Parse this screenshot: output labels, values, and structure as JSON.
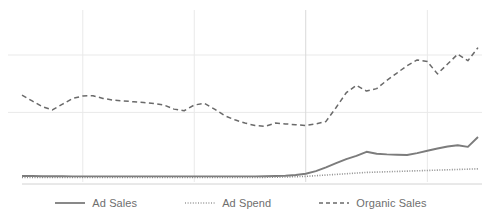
{
  "chart_data": {
    "type": "line",
    "title": "",
    "subtitle": "",
    "xlabel": "",
    "ylabel": "",
    "grid": true,
    "legend_position": "bottom",
    "xlim": [
      0,
      45
    ],
    "ylim": [
      0,
      100
    ],
    "xticks": [],
    "yticks": [],
    "gridlines": {
      "horizontal_y_values": [
        40,
        75
      ],
      "vertical_x_values": [
        6,
        17,
        28,
        40
      ]
    },
    "x": [
      0,
      1,
      2,
      3,
      4,
      5,
      6,
      7,
      8,
      9,
      10,
      11,
      12,
      13,
      14,
      15,
      16,
      17,
      18,
      19,
      20,
      21,
      22,
      23,
      24,
      25,
      26,
      27,
      28,
      29,
      30,
      31,
      32,
      33,
      34,
      35,
      36,
      37,
      38,
      39,
      40,
      41,
      42,
      43,
      44,
      45
    ],
    "series": [
      {
        "name": "Ad Sales",
        "style": "solid",
        "color": "#7c7c7c",
        "values": [
          1.2,
          1.2,
          1.1,
          1.1,
          1.1,
          1.0,
          1.0,
          1.0,
          1.0,
          1.0,
          1.0,
          1.0,
          1.0,
          1.0,
          1.0,
          1.0,
          1.0,
          1.0,
          1.0,
          1.0,
          1.0,
          1.0,
          1.0,
          1.0,
          1.1,
          1.2,
          1.4,
          1.8,
          2.6,
          4.2,
          6.5,
          9.0,
          11.5,
          13.5,
          16.0,
          14.8,
          14.4,
          14.2,
          14.0,
          15.2,
          16.6,
          18.0,
          19.2,
          20.0,
          19.0,
          25.0
        ]
      },
      {
        "name": "Ad Spend",
        "style": "dotted",
        "color": "#8e8e8e",
        "values": [
          0.3,
          0.3,
          0.3,
          0.3,
          0.3,
          0.3,
          0.3,
          0.3,
          0.3,
          0.3,
          0.3,
          0.3,
          0.3,
          0.3,
          0.3,
          0.3,
          0.3,
          0.3,
          0.3,
          0.3,
          0.3,
          0.3,
          0.3,
          0.3,
          0.4,
          0.5,
          0.6,
          0.8,
          1.0,
          1.4,
          1.8,
          2.2,
          2.6,
          3.0,
          3.4,
          3.6,
          3.8,
          4.0,
          4.2,
          4.4,
          4.6,
          4.8,
          5.0,
          5.2,
          5.4,
          5.6
        ]
      },
      {
        "name": "Organic Sales",
        "style": "dashed",
        "color": "#6a6a6a",
        "values": [
          50.5,
          47.0,
          43.5,
          41.5,
          45.0,
          48.5,
          50.0,
          50.2,
          48.5,
          47.5,
          47.0,
          46.5,
          46.0,
          45.5,
          44.5,
          42.0,
          41.0,
          44.5,
          45.5,
          42.0,
          38.0,
          35.5,
          33.5,
          32.0,
          31.5,
          33.5,
          33.0,
          32.5,
          32.0,
          33.0,
          34.5,
          43.0,
          52.0,
          56.5,
          53.0,
          54.5,
          59.5,
          64.0,
          68.5,
          72.0,
          71.0,
          63.5,
          69.5,
          75.5,
          71.5,
          79.5
        ]
      }
    ]
  },
  "legend": {
    "items": [
      {
        "label": "Ad Sales",
        "style": "solid",
        "color": "#7c7c7c"
      },
      {
        "label": "Ad Spend",
        "style": "dotted",
        "color": "#8e8e8e"
      },
      {
        "label": "Organic Sales",
        "style": "dashed",
        "color": "#6a6a6a"
      }
    ]
  },
  "theme": {
    "background": "#ffffff",
    "gridline_color": "#e9e9e9",
    "gridline_color_strong": "#d9d9d9",
    "text_color": "#6e6e6e"
  }
}
